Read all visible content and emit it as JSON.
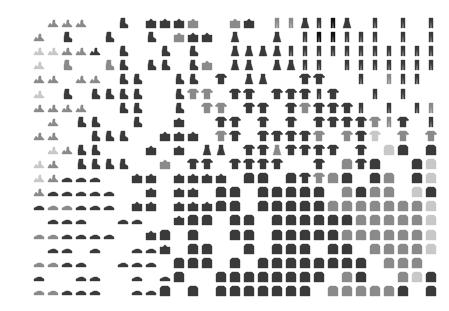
{
  "figure": {
    "kind": "image-grid-embedding",
    "grid": {
      "cols": 30,
      "rows": 20,
      "origin_x": 19,
      "origin_y": 17,
      "pitch_x": 14,
      "pitch_y": 14.1
    },
    "legend": {
      "S": "sandal",
      "K": "sneaker",
      "A": "ankle-boot",
      "B": "bag",
      "D": "dress",
      "T": "t-shirt-top",
      "P": "pullover",
      "C": "coat",
      "H": "shirt",
      "R": "trouser",
      ".": "empty"
    },
    "shade_legend": {
      "1": "#c8c8c8",
      "2": "#8a8a8a",
      "3": "#3a3a3a",
      "4": "#111111"
    },
    "rows": [
      "..SSS..A.BBBB..BB.RRDRRD.R.R.R",
      ".S.A..A..A.BBB.D..D.RRRRRR.R.R",
      ".SSSSS.A..A.A..DDDDRRRRRRRRRRR",
      ".S.A..AA.AA.AB.DD.DDRR.RRRRRRR",
      ".SS.SS.AA..AA.T.DD..TT..R.RRR.",
      ".S.A.AAAA..ATT.TT.TTTRT..R.R..",
      ".SSSS..AA..A.TT.TT.TTTTTR.R.RR",
      "..S.AA..A..B..TT.T.T.TTTTTRT.R",
      ".SS..AAA..BBB.TT.TTTTT.TTT.T.T",
      "..SSAA...B.B.DD.TTDTTTT.T.HH.H",
      ".SS.AAAA..B.TT.TTTT..T.HTH..HH",
      ".SSKKK..BB.BBBB.PP.PTTHH.HH.HH",
      ".SKKKKK..B.BB.PP.PPPPP.HHHH.HH",
      ".KKKKKK.BB.BBBCC.CCPPPPPHHHHHH",
      "..KKK..KK..BCC.CC.CPCCPPPHHHHH",
      ".KKKKKK..BC.C..CC.CCPPPPPPHHHH",
      "..KK.K..KKB.CC..C.CCP.PP.HHHHH",
      ".KKKK..KKK.CCC.C.CCCCCPPP.HHH.",
      ".K..KK..K.KC..CCCCCCCP.PP..HHH",
      ".KKKKK..KKC.C.CCCCCCC.PPPPPH.H"
    ],
    "shades": [
      "..222..3.3332..23.2233432.3.3.3",
      ".2.3..3..3.233.3..3.34433.3.3.3",
      ".11223.3..3.3..3333333333333333",
      ".1.2..23.33.32.33.3333.333333.3",
      ".22.22.33..33.3.33..33..3.233.",
      ".1.3.3333..322.33.3333.2..1.2.",
      ".2222..33..3.22.33.3233332.2.22",
      "..2.33..3..3..33.3.3.33332232.2",
      ".22..333..333.23.33332.231.2.2",
      "..1233...3.3.33.332333.3.21.1",
      ".12.3333..2.33.3333..3.2332..11",
      ".1233..33.3333.33.3332231.21.11",
      ".2333333..3.33.33.333332.2221.11",
      ".3223333.33.33333.3333222222211",
      "..333..33..33333.3333333222221",
      ".22333..33.33..33.3333322222211",
      "..33.3..333.33..3.333.33.222211",
      ".2233..333.333.3.33333333.222.",
      ".3..33..3.33..3333333.22..221",
      ".22333..333.3.3333333.22222.2"
    ]
  }
}
